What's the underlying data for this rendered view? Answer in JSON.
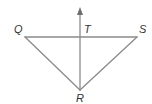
{
  "figure": {
    "type": "geometry-diagram",
    "points": [
      {
        "id": "Q",
        "label": "Q"
      },
      {
        "id": "S",
        "label": "S"
      },
      {
        "id": "T",
        "label": "T"
      },
      {
        "id": "R",
        "label": "R"
      }
    ],
    "segments": [
      {
        "id": "QS",
        "from": "Q",
        "to": "S"
      },
      {
        "id": "QR",
        "from": "Q",
        "to": "R"
      },
      {
        "id": "SR",
        "from": "S",
        "to": "R"
      }
    ],
    "rays": [
      {
        "id": "RT",
        "from": "R",
        "through": "T",
        "arrow": true
      }
    ],
    "colors": {
      "line": "#8a8a8a",
      "label": "#333333"
    }
  }
}
